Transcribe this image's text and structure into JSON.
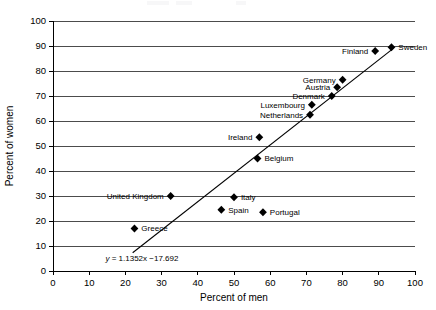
{
  "chart_data": {
    "type": "scatter",
    "title": "",
    "xlabel": "Percent of men",
    "ylabel": "Percent of women",
    "xlim": [
      0,
      100
    ],
    "ylim": [
      0,
      100
    ],
    "xticks": [
      0,
      10,
      20,
      30,
      40,
      50,
      60,
      70,
      80,
      90,
      100
    ],
    "yticks": [
      0,
      10,
      20,
      30,
      40,
      50,
      60,
      70,
      80,
      90,
      100
    ],
    "grid": "horizontal",
    "legend": "none",
    "marker": "filled-diamond",
    "marker_color": "#000000",
    "points": [
      {
        "label": "Greece",
        "x": 22.5,
        "y": 17.0,
        "label_side": "right"
      },
      {
        "label": "United Kingdom",
        "x": 32.5,
        "y": 30.0,
        "label_side": "left"
      },
      {
        "label": "Spain",
        "x": 46.5,
        "y": 24.5,
        "label_side": "right"
      },
      {
        "label": "Italy",
        "x": 50.0,
        "y": 29.5,
        "label_side": "right"
      },
      {
        "label": "Belgium",
        "x": 56.5,
        "y": 45.0,
        "label_side": "right"
      },
      {
        "label": "Ireland",
        "x": 57.0,
        "y": 53.5,
        "label_side": "left"
      },
      {
        "label": "Portugal",
        "x": 58.0,
        "y": 23.5,
        "label_side": "right"
      },
      {
        "label": "Netherlands",
        "x": 71.0,
        "y": 62.5,
        "label_side": "left"
      },
      {
        "label": "Luxembourg",
        "x": 71.5,
        "y": 66.5,
        "label_side": "left"
      },
      {
        "label": "Denmark",
        "x": 77.0,
        "y": 70.0,
        "label_side": "left"
      },
      {
        "label": "Austria",
        "x": 78.5,
        "y": 73.5,
        "label_side": "left"
      },
      {
        "label": "Germany",
        "x": 80.0,
        "y": 76.5,
        "label_side": "left"
      },
      {
        "label": "Finland",
        "x": 89.0,
        "y": 88.0,
        "label_side": "left"
      },
      {
        "label": "Sweden",
        "x": 93.5,
        "y": 89.5,
        "label_side": "right"
      }
    ],
    "trendline": {
      "equation_text": "y = 1.1352x −17.692",
      "slope": 1.1352,
      "intercept": -17.692,
      "x_start": 22.0,
      "x_end": 93.5
    }
  }
}
